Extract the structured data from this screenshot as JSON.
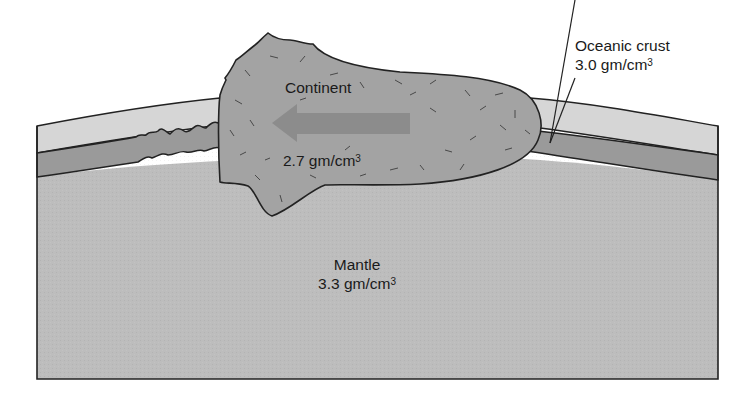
{
  "diagram": {
    "type": "cross-section",
    "colors": {
      "background": "#ffffff",
      "ocean_layer": "#d6d6d6",
      "oceanic_crust": "#9a9a9a",
      "mantle": "#bdbdbd",
      "continent": "#a3a3a3",
      "arrow": "#8a8a8a",
      "outline": "#222222",
      "text": "#1a1a1a"
    },
    "labels": {
      "continent": {
        "name": "Continent",
        "density_value": "2.7 gm/cm",
        "density_exp": "3"
      },
      "oceanic_crust": {
        "name": "Oceanic crust",
        "density_value": "3.0 gm/cm",
        "density_exp": "3"
      },
      "mantle": {
        "name": "Mantle",
        "density_value": "3.3 gm/cm",
        "density_exp": "3"
      }
    },
    "arrow": {
      "direction": "left",
      "meaning": "continent motion"
    }
  }
}
